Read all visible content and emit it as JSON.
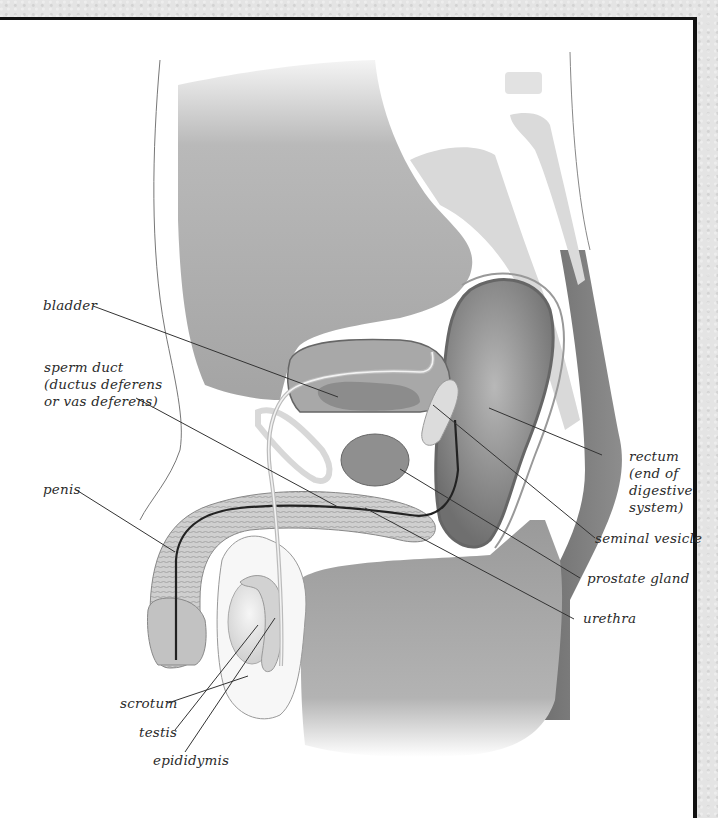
{
  "figure": {
    "colors": {
      "background": "#ffffff",
      "frame_border": "#111111",
      "margin": "#e4e4e4",
      "body_tissue": "#a9a9a9",
      "body_tissue_dark": "#7a7a7a",
      "organ_light": "#d6d6d6",
      "organ_mid": "#9e9e9e",
      "outline": "#555555",
      "label_text": "#2b2b2b",
      "leader_line": "#333333"
    }
  },
  "labels": {
    "bladder": "bladder",
    "sperm_duct": "sperm duct\n(ductus deferens\nor vas deferens)",
    "penis": "penis",
    "scrotum": "scrotum",
    "testis": "testis",
    "epididymis": "epididymis",
    "rectum": "rectum\n(end of\ndigestive\nsystem)",
    "seminal_vesicle": "seminal vesicle",
    "prostate_gland": "prostate gland",
    "urethra": "urethra"
  }
}
